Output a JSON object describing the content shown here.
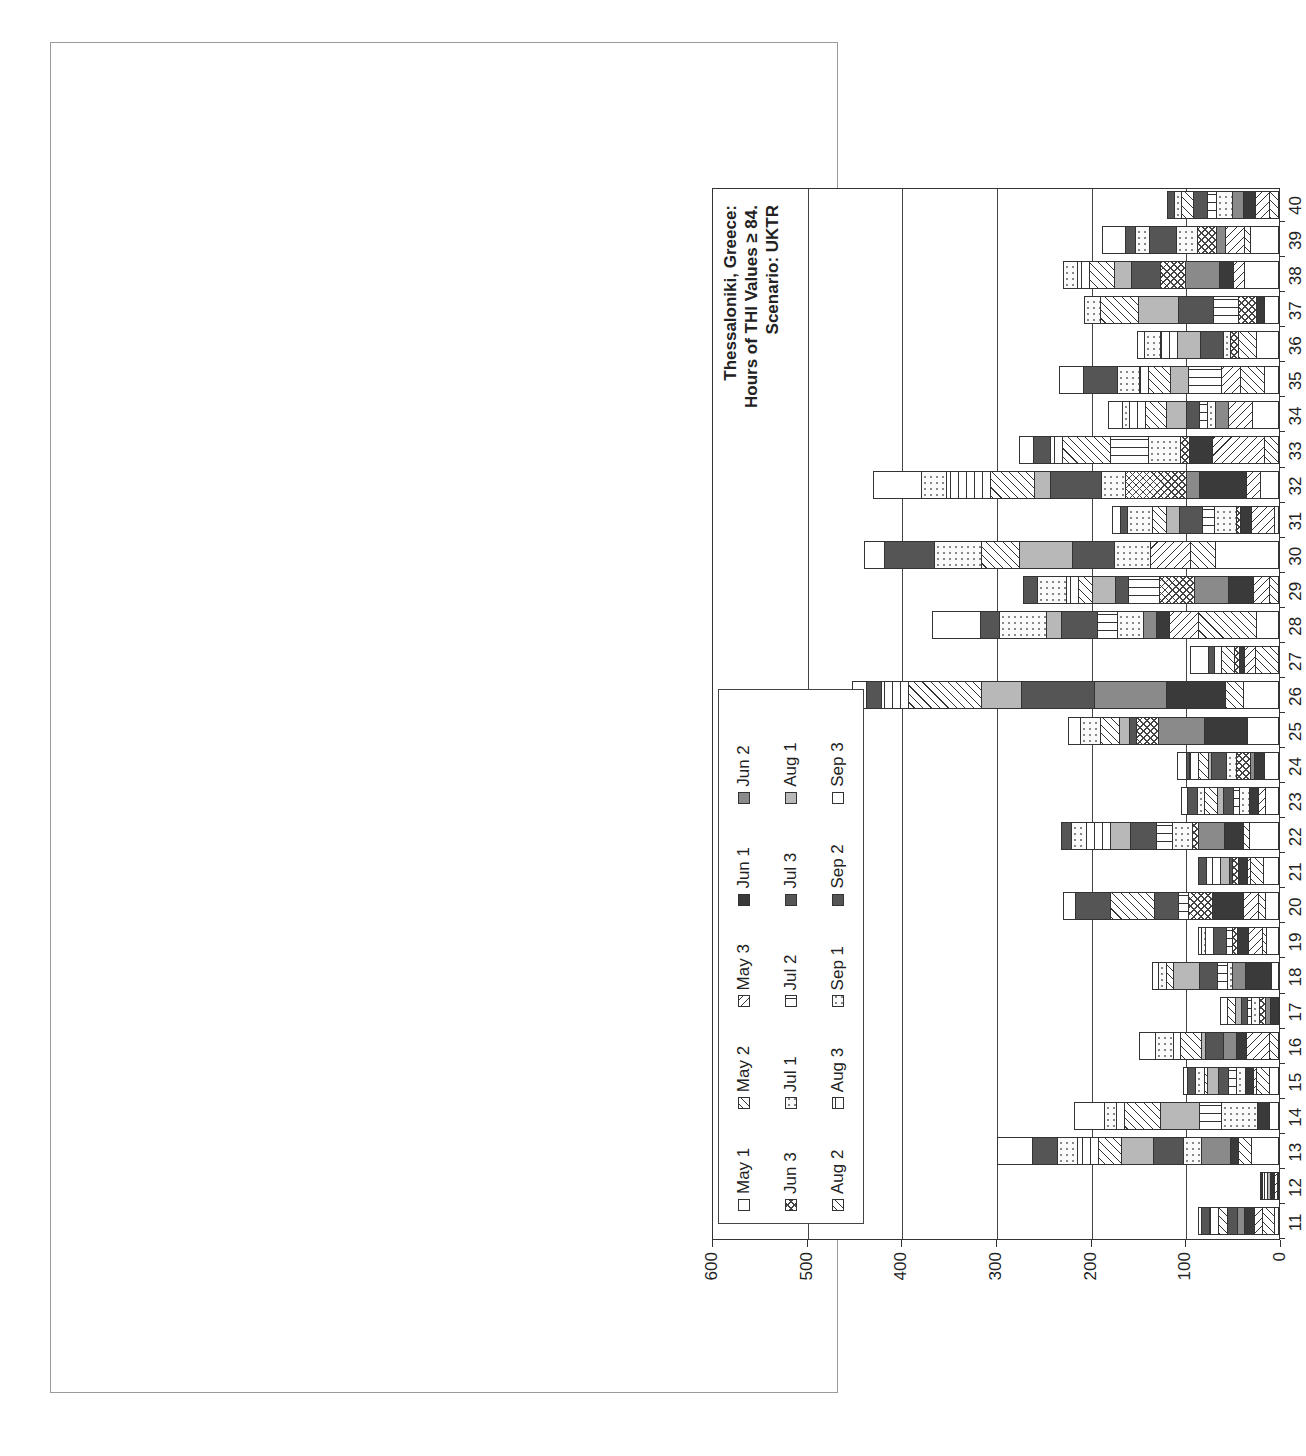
{
  "chart_data": {
    "type": "bar",
    "stacked": true,
    "orientation": "vertical (image rotated 90° counter-clockwise)",
    "title": "Thessaloniki, Greece: Hours of THI Values ≥ 84. Scenario: UKTR",
    "title_lines": [
      "Thessaloniki, Greece:",
      "Hours of THI Values ≥ 84.",
      "Scenario: UKTR"
    ],
    "xlabel": "",
    "ylabel": "",
    "ylim": [
      0,
      600
    ],
    "yticks": [
      0,
      100,
      200,
      300,
      400,
      500,
      600
    ],
    "grid": true,
    "legend_position": "upper-left inside plot",
    "legend": [
      "May 1",
      "May 2",
      "May 3",
      "Jun 1",
      "Jun 2",
      "Jun 3",
      "Jul 1",
      "Jul 2",
      "Jul 3",
      "Aug 1",
      "Aug 2",
      "Aug 3",
      "Sep 1",
      "Sep 2",
      "Sep 3"
    ],
    "categories": [
      "11",
      "12",
      "13",
      "14",
      "15",
      "16",
      "17",
      "18",
      "19",
      "20",
      "21",
      "22",
      "23",
      "24",
      "25",
      "26",
      "27",
      "28",
      "29",
      "30",
      "31",
      "32",
      "33",
      "34",
      "35",
      "36",
      "37",
      "38",
      "39",
      "40"
    ],
    "totals": [
      85,
      19,
      297,
      216,
      101,
      147,
      61,
      133,
      85,
      227,
      85,
      229,
      103,
      107,
      222,
      450,
      93,
      366,
      270,
      437,
      176,
      428,
      274,
      180,
      231,
      149,
      205,
      227,
      186,
      117
    ]
  },
  "figure": {
    "title_lines": [
      "Thessaloniki, Greece:",
      "Hours of THI Values ≥ 84.",
      "Scenario: UKTR"
    ]
  }
}
